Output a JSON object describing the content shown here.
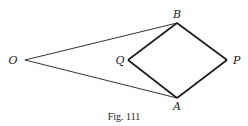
{
  "figure": {
    "caption": "Fig. 111",
    "colors": {
      "ink": "#1a1a1a",
      "background": "#ffffff"
    },
    "points": {
      "O": {
        "label": "O",
        "x": 25,
        "y": 60
      },
      "B": {
        "label": "B",
        "x": 177,
        "y": 23
      },
      "Q": {
        "label": "Q",
        "x": 128,
        "y": 60
      },
      "P": {
        "label": "P",
        "x": 227,
        "y": 60
      },
      "A": {
        "label": "A",
        "x": 177,
        "y": 98
      }
    },
    "segments": [
      {
        "from": "O",
        "to": "B",
        "weight": "thin"
      },
      {
        "from": "O",
        "to": "A",
        "weight": "thin"
      },
      {
        "from": "B",
        "to": "Q",
        "weight": "thick"
      },
      {
        "from": "Q",
        "to": "A",
        "weight": "thick"
      },
      {
        "from": "A",
        "to": "P",
        "weight": "thick"
      },
      {
        "from": "P",
        "to": "B",
        "weight": "thick"
      }
    ]
  }
}
